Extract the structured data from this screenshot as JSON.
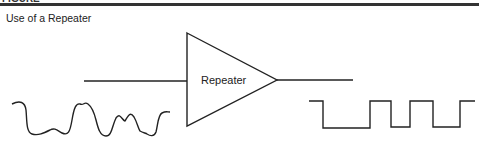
{
  "figure": {
    "header_cut_text": "FIGURE",
    "caption": "Use of a Repeater"
  },
  "diagram": {
    "block_label": "Repeater",
    "input_signal": "distorted analog wave",
    "output_signal": "regenerated square wave",
    "colors": {
      "stroke": "#222222",
      "rule": "#333333"
    }
  }
}
